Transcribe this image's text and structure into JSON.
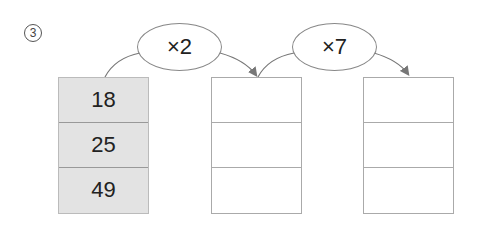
{
  "problem_number": "3",
  "operations": [
    {
      "label": "×2"
    },
    {
      "label": "×7"
    }
  ],
  "columns": [
    {
      "cells": [
        "18",
        "25",
        "49"
      ],
      "filled": true
    },
    {
      "cells": [
        "",
        "",
        ""
      ],
      "filled": false
    },
    {
      "cells": [
        "",
        "",
        ""
      ],
      "filled": false
    }
  ],
  "colors": {
    "filled_bg": "#e3e3e3",
    "border": "#aaaaaa",
    "arrow": "#777777"
  }
}
